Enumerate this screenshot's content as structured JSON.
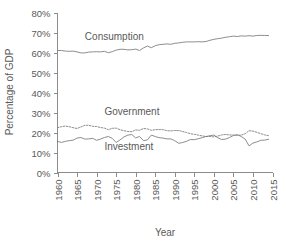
{
  "chart_data": {
    "type": "line",
    "title": "",
    "xlabel": "Year",
    "ylabel": "Percentage of GDP",
    "xlim": [
      1960,
      2015
    ],
    "ylim": [
      0,
      80
    ],
    "grid": false,
    "legend_position": "inline-annotations",
    "xticks": [
      "1960",
      "1965",
      "1970",
      "1975",
      "1980",
      "1985",
      "1990",
      "1995",
      "2000",
      "2005",
      "2010",
      "2015"
    ],
    "yticks": [
      "0%",
      "10%",
      "20%",
      "30%",
      "40%",
      "50%",
      "60%",
      "70%",
      "80%"
    ],
    "x": [
      1960,
      1961,
      1962,
      1963,
      1964,
      1965,
      1966,
      1967,
      1968,
      1969,
      1970,
      1971,
      1972,
      1973,
      1974,
      1975,
      1976,
      1977,
      1978,
      1979,
      1980,
      1981,
      1982,
      1983,
      1984,
      1985,
      1986,
      1987,
      1988,
      1989,
      1990,
      1991,
      1992,
      1993,
      1994,
      1995,
      1996,
      1997,
      1998,
      1999,
      2000,
      2001,
      2002,
      2003,
      2004,
      2005,
      2006,
      2007,
      2008,
      2009,
      2010,
      2011,
      2012,
      2013,
      2014
    ],
    "series": [
      {
        "name": "Consumption",
        "style": "solid",
        "color": "#808080",
        "label_x": 1967,
        "label_y": 66.5,
        "values": [
          61.0,
          61.0,
          60.7,
          60.6,
          60.7,
          60.3,
          59.8,
          59.8,
          60.2,
          60.3,
          60.4,
          60.3,
          60.6,
          59.9,
          60.4,
          61.2,
          61.6,
          61.6,
          61.3,
          61.4,
          61.7,
          61.0,
          62.3,
          63.2,
          62.4,
          63.4,
          63.9,
          64.1,
          64.3,
          64.1,
          64.6,
          64.8,
          65.1,
          65.3,
          65.3,
          65.3,
          65.4,
          65.3,
          65.5,
          66.1,
          66.6,
          66.9,
          67.2,
          67.6,
          67.9,
          68.2,
          68.0,
          68.3,
          68.2,
          68.4,
          68.2,
          68.5,
          68.6,
          68.5,
          68.5
        ]
      },
      {
        "name": "Government",
        "style": "dotted",
        "color": "#808080",
        "label_x": 1972,
        "label_y": 29.0,
        "values": [
          22.4,
          22.9,
          23.2,
          22.9,
          22.4,
          22.0,
          22.8,
          23.6,
          23.6,
          23.1,
          23.0,
          22.5,
          22.2,
          21.4,
          22.1,
          22.2,
          21.4,
          20.9,
          20.5,
          20.4,
          21.3,
          21.1,
          22.0,
          21.8,
          21.1,
          21.4,
          21.5,
          21.4,
          20.9,
          20.8,
          21.0,
          21.0,
          20.5,
          20.0,
          19.4,
          19.1,
          18.7,
          18.3,
          18.0,
          18.0,
          17.8,
          18.2,
          18.8,
          19.0,
          18.8,
          18.7,
          18.6,
          18.7,
          19.4,
          20.9,
          20.7,
          20.1,
          19.4,
          18.8,
          18.4
        ]
      },
      {
        "name": "Investment",
        "style": "solid",
        "color": "#808080",
        "label_x": 1972,
        "label_y": 11.5,
        "values": [
          15.6,
          15.0,
          15.6,
          15.9,
          16.2,
          17.2,
          17.5,
          16.7,
          16.8,
          17.1,
          16.1,
          16.7,
          17.5,
          18.0,
          17.1,
          15.0,
          16.3,
          17.8,
          18.7,
          19.0,
          17.3,
          18.0,
          15.9,
          16.3,
          18.7,
          18.0,
          17.4,
          17.2,
          16.8,
          16.8,
          15.9,
          14.6,
          15.0,
          15.6,
          16.5,
          16.4,
          16.9,
          17.4,
          18.0,
          18.4,
          18.7,
          17.4,
          16.5,
          16.7,
          17.5,
          18.5,
          18.9,
          18.0,
          16.7,
          13.3,
          14.7,
          15.3,
          16.1,
          16.2,
          16.6
        ]
      }
    ]
  },
  "axis": {
    "x_title": "Year",
    "y_title": "Percentage of GDP"
  }
}
